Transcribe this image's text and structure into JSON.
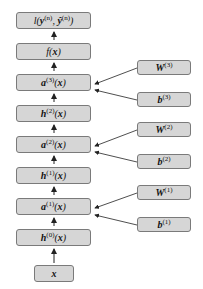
{
  "diagram": {
    "type": "feedforward-network-computation-graph",
    "main_chain": [
      {
        "id": "loss",
        "label": "l(y(n), ŷ(n))"
      },
      {
        "id": "f",
        "label": "f(x)"
      },
      {
        "id": "a3",
        "label": "a(3)(x)"
      },
      {
        "id": "h2",
        "label": "h(2)(x)"
      },
      {
        "id": "a2",
        "label": "a(2)(x)"
      },
      {
        "id": "h1",
        "label": "h(1)(x)"
      },
      {
        "id": "a1",
        "label": "a(1)(x)"
      },
      {
        "id": "h0",
        "label": "h(0)(x)"
      },
      {
        "id": "x",
        "label": "x"
      }
    ],
    "parameters": [
      {
        "id": "W3",
        "label": "W(3)",
        "feeds": "a3"
      },
      {
        "id": "b3",
        "label": "b(3)",
        "feeds": "a3"
      },
      {
        "id": "W2",
        "label": "W(2)",
        "feeds": "a2"
      },
      {
        "id": "b2",
        "label": "b(2)",
        "feeds": "a2"
      },
      {
        "id": "W1",
        "label": "W(1)",
        "feeds": "a1"
      },
      {
        "id": "b1",
        "label": "b(1)",
        "feeds": "a1"
      }
    ],
    "colors": {
      "box_fill": "#d6d6d6",
      "box_border": "#7a7a7a",
      "arrow": "#222222"
    }
  }
}
